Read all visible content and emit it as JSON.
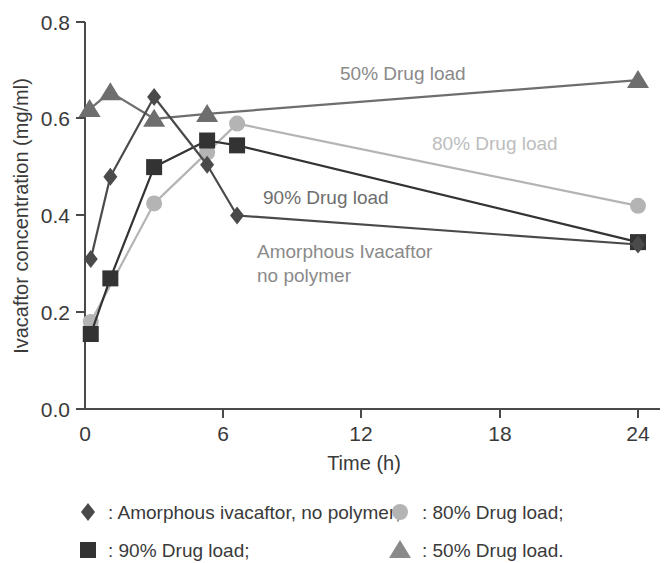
{
  "chart_data": {
    "type": "line",
    "title": "",
    "xlabel": "Time (h)",
    "ylabel": "Ivacaftor concentration (mg/ml)",
    "xlim": [
      0,
      25.2
    ],
    "ylim": [
      0.0,
      0.8
    ],
    "xticks": [
      0,
      6,
      12,
      18,
      24
    ],
    "xticklabels": [
      "0",
      "6",
      "12",
      "18",
      "24"
    ],
    "yticks": [
      0.0,
      0.2,
      0.4,
      0.6,
      0.8
    ],
    "yticklabels": [
      "0.0",
      "0.2",
      "0.4",
      "0.6",
      "0.8"
    ],
    "grid": false,
    "legend_position": "below-axes",
    "series": [
      {
        "name": "Amorphous ivacaftor, no polymer",
        "marker": "diamond",
        "color": "#4a4a4a",
        "x": [
          0.25,
          1.1,
          3.0,
          5.3,
          6.6,
          24.0
        ],
        "y": [
          0.31,
          0.48,
          0.645,
          0.505,
          0.4,
          0.34
        ]
      },
      {
        "name": "90% Drug load",
        "marker": "square",
        "color": "#333333",
        "x": [
          0.25,
          1.1,
          3.0,
          5.3,
          6.6,
          24.0
        ],
        "y": [
          0.155,
          0.27,
          0.5,
          0.555,
          0.545,
          0.345
        ]
      },
      {
        "name": "80% Drug load",
        "marker": "circle",
        "color": "#b4b4b4",
        "x": [
          0.25,
          3.0,
          5.3,
          6.6,
          24.0
        ],
        "y": [
          0.18,
          0.425,
          0.53,
          0.59,
          0.42
        ]
      },
      {
        "name": "50% Drug load",
        "marker": "triangle",
        "color": "#6e6e6e",
        "x": [
          0.2,
          1.1,
          3.0,
          5.3,
          24.0
        ],
        "y": [
          0.62,
          0.655,
          0.6,
          0.61,
          0.68
        ]
      }
    ],
    "annotations": [
      {
        "text": "50% Drug load",
        "x": 340,
        "y": 80,
        "color": "#8a8a8a"
      },
      {
        "text": "80% Drug load",
        "x": 432,
        "y": 150,
        "color": "#bdbdbd"
      },
      {
        "text": "90% Drug load",
        "x": 263,
        "y": 204,
        "color": "#6e6e6e"
      },
      {
        "text": "Amorphous Ivacaftor",
        "x": 257,
        "y": 258,
        "color": "#8a8a8a"
      },
      {
        "text": "no polymer",
        "x": 257,
        "y": 282,
        "color": "#8a8a8a"
      }
    ]
  },
  "legend": {
    "entries": [
      {
        "marker": "diamond",
        "color": "#4a4a4a",
        "label": ": Amorphous ivacaftor, no polymer;"
      },
      {
        "marker": "circle",
        "color": "#b4b4b4",
        "label": ": 80% Drug load;"
      },
      {
        "marker": "square",
        "color": "#333333",
        "label": ": 90% Drug load;"
      },
      {
        "marker": "triangle",
        "color": "#8a8a8a",
        "label": ": 50% Drug load."
      }
    ]
  }
}
